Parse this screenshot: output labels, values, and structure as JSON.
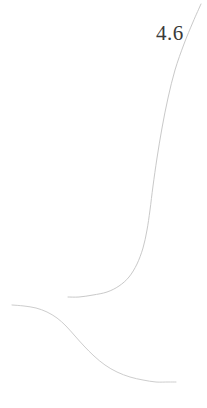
{
  "figure": {
    "background_color": "#ffffff",
    "width": 207,
    "height": 408
  },
  "annotations": [
    {
      "name": "value-label",
      "text": "4.6",
      "color": "#3a3a3a",
      "x": 156,
      "y": 21
    }
  ],
  "chart_data": {
    "type": "line",
    "title": "",
    "subtitle": "",
    "xlabel": "",
    "ylabel": "",
    "xlim": [
      0,
      207
    ],
    "ylim": [
      408,
      0
    ],
    "grid": false,
    "legend": null,
    "axes_visible": false,
    "tick_labels": {
      "x": [],
      "y": []
    },
    "annotations": [
      "4.6"
    ],
    "series": [
      {
        "name": "upper-curve",
        "color": "#c9c9c9",
        "line_width": 1.0,
        "points": [
          [
            201,
            4
          ],
          [
            193,
            22
          ],
          [
            184,
            44
          ],
          [
            175,
            70
          ],
          [
            168,
            98
          ],
          [
            162,
            128
          ],
          [
            157,
            158
          ],
          [
            153,
            186
          ],
          [
            150,
            210
          ],
          [
            147,
            230
          ],
          [
            143,
            248
          ],
          [
            137,
            264
          ],
          [
            129,
            277
          ],
          [
            119,
            286
          ],
          [
            107,
            292
          ],
          [
            93,
            295
          ],
          [
            79,
            297
          ],
          [
            68,
            297
          ]
        ]
      },
      {
        "name": "lower-curve",
        "color": "#cdcdcd",
        "line_width": 1.0,
        "points": [
          [
            12,
            305
          ],
          [
            24,
            306
          ],
          [
            36,
            308
          ],
          [
            47,
            312
          ],
          [
            57,
            318
          ],
          [
            66,
            326
          ],
          [
            75,
            336
          ],
          [
            84,
            346
          ],
          [
            94,
            356
          ],
          [
            105,
            365
          ],
          [
            117,
            372
          ],
          [
            130,
            377
          ],
          [
            143,
            380
          ],
          [
            156,
            382
          ],
          [
            168,
            382
          ],
          [
            176,
            382
          ]
        ]
      }
    ]
  }
}
